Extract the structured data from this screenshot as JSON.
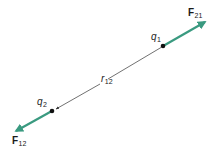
{
  "diagram": {
    "title": "",
    "colors": {
      "force_vector": "#3a9a80",
      "separation_line": "#333333",
      "charge_dot": "#111111",
      "background": "#ffffff"
    },
    "charges": [
      {
        "id": "q1",
        "symbol": "q",
        "subscript": "1",
        "x": 163,
        "y": 46
      },
      {
        "id": "q2",
        "symbol": "q",
        "subscript": "2",
        "x": 52,
        "y": 111
      }
    ],
    "separation": {
      "symbol": "r",
      "subscript": "12",
      "from": "q1",
      "to": "q2"
    },
    "forces": [
      {
        "id": "F21",
        "symbol": "F",
        "subscript": "21",
        "on": "q1",
        "direction": "away from q2",
        "tip": [
          207,
          21
        ]
      },
      {
        "id": "F12",
        "symbol": "F",
        "subscript": "12",
        "on": "q2",
        "direction": "away from q1",
        "tip": [
          14,
          132
        ]
      }
    ]
  }
}
